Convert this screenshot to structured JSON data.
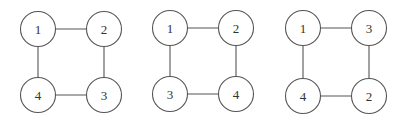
{
  "graphs": [
    {
      "name": "graph-1",
      "corners": {
        "top_left": "1",
        "top_right": "2",
        "bottom_left": "4",
        "bottom_right": "3"
      },
      "edges": [
        [
          "1",
          "2"
        ],
        [
          "2",
          "3"
        ],
        [
          "3",
          "4"
        ],
        [
          "4",
          "1"
        ]
      ]
    },
    {
      "name": "graph-2",
      "corners": {
        "top_left": "1",
        "top_right": "2",
        "bottom_left": "3",
        "bottom_right": "4"
      },
      "edges": [
        [
          "1",
          "2"
        ],
        [
          "2",
          "4"
        ],
        [
          "4",
          "3"
        ],
        [
          "3",
          "1"
        ]
      ]
    },
    {
      "name": "graph-3",
      "corners": {
        "top_left": "1",
        "top_right": "3",
        "bottom_left": "4",
        "bottom_right": "2"
      },
      "edges": [
        [
          "1",
          "3"
        ],
        [
          "3",
          "2"
        ],
        [
          "2",
          "4"
        ],
        [
          "4",
          "1"
        ]
      ]
    }
  ],
  "colors": {
    "stroke": "#555555",
    "label": "#333333",
    "background": "#ffffff"
  }
}
